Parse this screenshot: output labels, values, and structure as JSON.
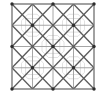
{
  "figure": {
    "title": "Geometric Tiling Pattern",
    "canvas": {
      "width": 107,
      "height": 97,
      "background": "#ffffff"
    },
    "frame": {
      "name": "outer-square-border",
      "x": 12,
      "y": 4,
      "width": 82,
      "height": 85,
      "stroke": "#7a7a7a",
      "stroke_width": 1.1
    },
    "grid": {
      "columns": 4,
      "rows": 4,
      "vertical_x": [
        12,
        32.5,
        53,
        73.5,
        94
      ],
      "horizontal_y": [
        4,
        25.25,
        46.5,
        67.75,
        89
      ],
      "stroke": "#9c9c9c",
      "stroke_width": 0.9
    },
    "diagonals": {
      "stroke": "#5a5a5a",
      "stroke_width": 1.3,
      "note": "Full-length diagonals at 45 degrees crossing every grid cell, producing an X in each 2x2 block and a diamond lattice overall."
    },
    "nodes": {
      "name": "lattice-node-dot",
      "radius": 1.7,
      "fill": "#2e2e2e",
      "points": [
        {
          "x": 32.5,
          "y": 25.25
        },
        {
          "x": 73.5,
          "y": 25.25
        },
        {
          "x": 53,
          "y": 46.5
        },
        {
          "x": 32.5,
          "y": 67.75
        },
        {
          "x": 73.5,
          "y": 67.75
        },
        {
          "x": 53,
          "y": 4
        },
        {
          "x": 53,
          "y": 89
        },
        {
          "x": 12,
          "y": 46.5
        },
        {
          "x": 94,
          "y": 46.5
        },
        {
          "x": 12,
          "y": 4
        },
        {
          "x": 94,
          "y": 4
        },
        {
          "x": 12,
          "y": 89
        },
        {
          "x": 94,
          "y": 89
        }
      ]
    },
    "motifs": {
      "name": "faint-octagon-motif",
      "stroke": "#d9d9d9",
      "stroke_width": 0.8,
      "centers": [
        {
          "x": 32.5,
          "y": 25.25
        },
        {
          "x": 73.5,
          "y": 25.25
        },
        {
          "x": 32.5,
          "y": 67.75
        },
        {
          "x": 73.5,
          "y": 67.75
        },
        {
          "x": 53,
          "y": 46.5
        }
      ],
      "radius": 11
    },
    "colors": {
      "border": "#7a7a7a",
      "grid_line": "#9c9c9c",
      "diagonal_line": "#5a5a5a",
      "node_fill": "#2e2e2e",
      "motif_line": "#d9d9d9",
      "background": "#ffffff"
    }
  }
}
